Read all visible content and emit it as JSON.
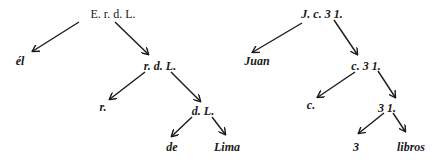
{
  "trees": [
    {
      "name": "left-tree",
      "nodes": [
        {
          "id": "root",
          "label": "E. r. d. L.",
          "x": 113,
          "y": 14,
          "style": "roman"
        },
        {
          "id": "el",
          "label": "él",
          "x": 20,
          "y": 61,
          "style": "leaf"
        },
        {
          "id": "rdl",
          "label": "r. d. L.",
          "x": 160,
          "y": 66,
          "style": "italic"
        },
        {
          "id": "r",
          "label": "r.",
          "x": 103,
          "y": 107,
          "style": "italic"
        },
        {
          "id": "dl",
          "label": "d. L.",
          "x": 203,
          "y": 111,
          "style": "italic"
        },
        {
          "id": "de",
          "label": "de",
          "x": 172,
          "y": 147,
          "style": "leaf"
        },
        {
          "id": "lima",
          "label": "Lima",
          "x": 227,
          "y": 147,
          "style": "leaf"
        }
      ],
      "edges": [
        {
          "from": [
            79,
            22
          ],
          "to": [
            33,
            51
          ]
        },
        {
          "from": [
            115,
            22
          ],
          "to": [
            148,
            54
          ]
        },
        {
          "from": [
            145,
            72
          ],
          "to": [
            110,
            99
          ]
        },
        {
          "from": [
            171,
            72
          ],
          "to": [
            200,
            101
          ]
        },
        {
          "from": [
            192,
            117
          ],
          "to": [
            172,
            136
          ]
        },
        {
          "from": [
            212,
            117
          ],
          "to": [
            225,
            134
          ]
        }
      ]
    },
    {
      "name": "right-tree",
      "nodes": [
        {
          "id": "root",
          "label": "J. c. 3 1.",
          "x": 322,
          "y": 14,
          "style": "italic"
        },
        {
          "id": "juan",
          "label": "Juan",
          "x": 257,
          "y": 61,
          "style": "leaf"
        },
        {
          "id": "c31",
          "label": "c. 3 1.",
          "x": 366,
          "y": 66,
          "style": "italic"
        },
        {
          "id": "c",
          "label": "c.",
          "x": 311,
          "y": 105,
          "style": "italic"
        },
        {
          "id": "31",
          "label": "3 1.",
          "x": 387,
          "y": 108,
          "style": "italic"
        },
        {
          "id": "3",
          "label": "3",
          "x": 356,
          "y": 147,
          "style": "leaf"
        },
        {
          "id": "libros",
          "label": "libros",
          "x": 411,
          "y": 147,
          "style": "leaf"
        }
      ],
      "edges": [
        {
          "from": [
            302,
            23
          ],
          "to": [
            253,
            52
          ]
        },
        {
          "from": [
            334,
            20
          ],
          "to": [
            357,
            54
          ]
        },
        {
          "from": [
            355,
            72
          ],
          "to": [
            318,
            97
          ]
        },
        {
          "from": [
            378,
            71
          ],
          "to": [
            395,
            97
          ]
        },
        {
          "from": [
            384,
            113
          ],
          "to": [
            359,
            133
          ]
        },
        {
          "from": [
            393,
            113
          ],
          "to": [
            405,
            131
          ]
        }
      ]
    }
  ],
  "colors": {
    "ink": "#1a1a1a",
    "background": "#ffffff"
  }
}
